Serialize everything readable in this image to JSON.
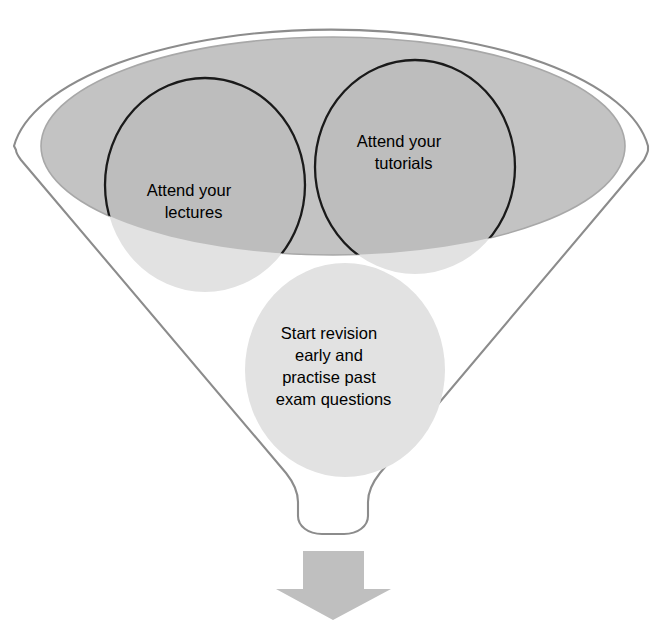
{
  "diagram": {
    "type": "funnel-diagram",
    "colors": {
      "background": "#ffffff",
      "funnel_outline": "#8c8c8c",
      "funnel_mouth_ellipse": "#c3c3c3",
      "bubble_fill_light": "#e2e2e2",
      "bubble_fill_over_ellipse": "#bdbdbd",
      "bubble_outline": "#1a1a1a",
      "arrow_fill": "#bfbfbf",
      "text": "#000000"
    },
    "funnel": {
      "name": "funnel-outline",
      "mouth_ellipse_label": "funnel-mouth",
      "spout_label": "funnel-spout"
    },
    "bubbles": [
      {
        "id": "attend-lectures",
        "name": "bubble-attend-lectures",
        "outlined": true,
        "cx": 205,
        "cy": 185,
        "rx": 100,
        "ry": 107,
        "text_lines": [
          "Attend your",
          "lectures"
        ],
        "text_cx": 205,
        "text_cy": 201
      },
      {
        "id": "attend-tutorials",
        "name": "bubble-attend-tutorials",
        "outlined": true,
        "cx": 415,
        "cy": 167,
        "rx": 100,
        "ry": 107,
        "text_lines": [
          "Attend your",
          "tutorials"
        ],
        "text_cx": 415,
        "text_cy": 152
      },
      {
        "id": "start-revision",
        "name": "bubble-start-revision",
        "outlined": false,
        "cx": 345,
        "cy": 370,
        "rx": 100,
        "ry": 107,
        "text_lines": [
          "Start revision",
          "early and",
          "practise past",
          "exam questions"
        ],
        "text_cx": 345,
        "text_cy": 368
      }
    ],
    "arrow": {
      "name": "down-arrow",
      "direction": "down",
      "cx": 333,
      "top": 551,
      "bottom": 620
    }
  }
}
